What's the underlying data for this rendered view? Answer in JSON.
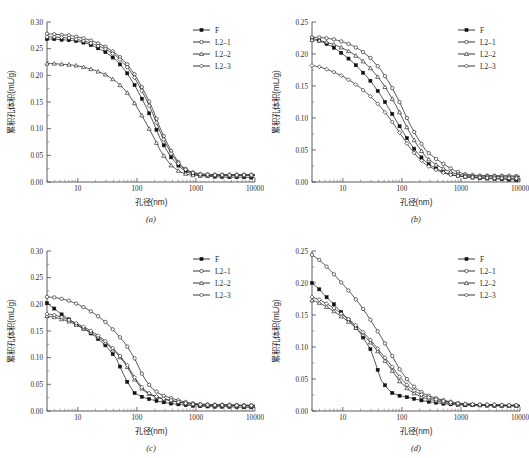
{
  "figure": {
    "panel_count": 4,
    "shared_xlabel": "孔径(nm)",
    "shared_ylabel": "累积孔体积(mL/g)",
    "series_names": [
      "F",
      "L2–1",
      "L2–2",
      "L2–3"
    ],
    "markers": [
      "filled-square",
      "open-circle",
      "open-triangle",
      "open-diamond"
    ],
    "line_color": "#222222"
  },
  "chart_data": [
    {
      "type": "line",
      "panel": "(a)",
      "title": "",
      "xlabel": "孔径(nm)",
      "ylabel": "累积孔体积(mL/g)",
      "xscale": "log",
      "xlim": [
        3,
        10000
      ],
      "ylim": [
        0.0,
        0.3
      ],
      "xticks": [
        10,
        100,
        1000,
        10000
      ],
      "xticklabels": [
        "10",
        "100",
        "1000",
        "10000"
      ],
      "yticks": [
        0.0,
        0.05,
        0.1,
        0.15,
        0.2,
        0.25,
        0.3
      ],
      "yticklabels": [
        "0.00",
        "0.05",
        "0.10",
        "0.15",
        "0.20",
        "0.25",
        "0.30"
      ],
      "grid": false,
      "legend_position": "top-right",
      "x": [
        3,
        4,
        5,
        7,
        10,
        14,
        20,
        30,
        45,
        65,
        90,
        130,
        180,
        260,
        380,
        550,
        800,
        1200,
        2000,
        3500,
        6000,
        10000
      ],
      "series": [
        {
          "name": "F",
          "marker": "filled-square",
          "values": [
            0.268,
            0.268,
            0.267,
            0.266,
            0.264,
            0.26,
            0.253,
            0.243,
            0.228,
            0.208,
            0.183,
            0.15,
            0.118,
            0.076,
            0.046,
            0.026,
            0.016,
            0.012,
            0.01,
            0.009,
            0.009,
            0.008
          ]
        },
        {
          "name": "L2–1",
          "marker": "open-circle",
          "values": [
            0.278,
            0.277,
            0.276,
            0.275,
            0.272,
            0.268,
            0.262,
            0.253,
            0.24,
            0.224,
            0.203,
            0.172,
            0.14,
            0.095,
            0.058,
            0.031,
            0.019,
            0.015,
            0.014,
            0.014,
            0.014,
            0.014
          ]
        },
        {
          "name": "L2–2",
          "marker": "open-triangle",
          "values": [
            0.222,
            0.222,
            0.221,
            0.22,
            0.218,
            0.214,
            0.209,
            0.201,
            0.188,
            0.171,
            0.149,
            0.119,
            0.09,
            0.055,
            0.031,
            0.018,
            0.013,
            0.012,
            0.012,
            0.012,
            0.012,
            0.012
          ]
        },
        {
          "name": "L2–3",
          "marker": "open-diamond",
          "values": [
            0.272,
            0.272,
            0.271,
            0.27,
            0.267,
            0.263,
            0.257,
            0.249,
            0.236,
            0.219,
            0.197,
            0.165,
            0.132,
            0.088,
            0.053,
            0.029,
            0.018,
            0.014,
            0.013,
            0.013,
            0.013,
            0.013
          ]
        }
      ]
    },
    {
      "type": "line",
      "panel": "(b)",
      "title": "",
      "xlabel": "孔径(nm)",
      "ylabel": "累积孔体积(mL/g)",
      "xscale": "log",
      "xlim": [
        3,
        10000
      ],
      "ylim": [
        0.0,
        0.25
      ],
      "xticks": [
        10,
        100,
        1000,
        10000
      ],
      "xticklabels": [
        "10",
        "100",
        "1000",
        "10000"
      ],
      "yticks": [
        0.0,
        0.05,
        0.1,
        0.15,
        0.2,
        0.25
      ],
      "yticklabels": [
        "0.00",
        "0.05",
        "0.10",
        "0.15",
        "0.20",
        "0.25"
      ],
      "grid": false,
      "legend_position": "top-right",
      "x": [
        3,
        4,
        5,
        7,
        10,
        14,
        20,
        30,
        45,
        65,
        90,
        130,
        180,
        260,
        380,
        550,
        800,
        1200,
        2000,
        3500,
        6000,
        10000
      ],
      "series": [
        {
          "name": "F",
          "marker": "filled-square",
          "values": [
            0.225,
            0.221,
            0.217,
            0.21,
            0.2,
            0.189,
            0.175,
            0.157,
            0.134,
            0.11,
            0.088,
            0.064,
            0.046,
            0.03,
            0.021,
            0.014,
            0.01,
            0.008,
            0.006,
            0.005,
            0.004,
            0.003
          ]
        },
        {
          "name": "L2–1",
          "marker": "open-circle",
          "values": [
            0.226,
            0.226,
            0.225,
            0.223,
            0.219,
            0.214,
            0.206,
            0.193,
            0.174,
            0.151,
            0.126,
            0.094,
            0.07,
            0.048,
            0.036,
            0.026,
            0.017,
            0.012,
            0.01,
            0.01,
            0.01,
            0.009
          ]
        },
        {
          "name": "L2–2",
          "marker": "open-triangle",
          "values": [
            0.222,
            0.221,
            0.219,
            0.215,
            0.209,
            0.202,
            0.192,
            0.177,
            0.157,
            0.134,
            0.11,
            0.08,
            0.058,
            0.038,
            0.027,
            0.019,
            0.013,
            0.01,
            0.009,
            0.009,
            0.008,
            0.008
          ]
        },
        {
          "name": "L2–3",
          "marker": "open-diamond",
          "values": [
            0.182,
            0.18,
            0.177,
            0.172,
            0.165,
            0.157,
            0.147,
            0.133,
            0.116,
            0.097,
            0.078,
            0.056,
            0.04,
            0.026,
            0.019,
            0.013,
            0.01,
            0.008,
            0.007,
            0.006,
            0.006,
            0.005
          ]
        }
      ]
    },
    {
      "type": "line",
      "panel": "(c)",
      "title": "",
      "xlabel": "孔径(nm)",
      "ylabel": "累积孔体积(mL/g)",
      "xscale": "log",
      "xlim": [
        3,
        10000
      ],
      "ylim": [
        0.0,
        0.3
      ],
      "xticks": [
        10,
        100,
        1000,
        10000
      ],
      "xticklabels": [
        "10",
        "100",
        "1000",
        "10000"
      ],
      "yticks": [
        0.0,
        0.05,
        0.1,
        0.15,
        0.2,
        0.25,
        0.3
      ],
      "yticklabels": [
        "0.00",
        "0.05",
        "0.10",
        "0.15",
        "0.20",
        "0.25",
        "0.30"
      ],
      "grid": false,
      "legend_position": "top-right",
      "x": [
        3,
        4,
        5,
        7,
        10,
        14,
        20,
        30,
        45,
        65,
        90,
        130,
        180,
        260,
        380,
        550,
        800,
        1200,
        2000,
        3500,
        6000,
        10000
      ],
      "series": [
        {
          "name": "F",
          "marker": "filled-square",
          "values": [
            0.202,
            0.192,
            0.183,
            0.172,
            0.161,
            0.151,
            0.139,
            0.122,
            0.098,
            0.059,
            0.034,
            0.025,
            0.021,
            0.017,
            0.014,
            0.012,
            0.01,
            0.009,
            0.008,
            0.008,
            0.007,
            0.007
          ]
        },
        {
          "name": "L2–1",
          "marker": "open-circle",
          "values": [
            0.214,
            0.213,
            0.211,
            0.207,
            0.2,
            0.192,
            0.181,
            0.166,
            0.146,
            0.125,
            0.1,
            0.063,
            0.042,
            0.03,
            0.024,
            0.019,
            0.015,
            0.013,
            0.012,
            0.012,
            0.011,
            0.011
          ]
        },
        {
          "name": "L2–2",
          "marker": "open-triangle",
          "values": [
            0.178,
            0.176,
            0.173,
            0.168,
            0.16,
            0.152,
            0.142,
            0.127,
            0.109,
            0.087,
            0.06,
            0.038,
            0.029,
            0.023,
            0.019,
            0.016,
            0.013,
            0.011,
            0.01,
            0.01,
            0.01,
            0.009
          ]
        },
        {
          "name": "L2–3",
          "marker": "open-diamond",
          "values": [
            0.182,
            0.18,
            0.177,
            0.171,
            0.163,
            0.155,
            0.145,
            0.13,
            0.111,
            0.09,
            0.064,
            0.04,
            0.03,
            0.024,
            0.02,
            0.016,
            0.013,
            0.012,
            0.011,
            0.011,
            0.01,
            0.01
          ]
        }
      ]
    },
    {
      "type": "line",
      "panel": "(d)",
      "title": "",
      "xlabel": "孔径(nm)",
      "ylabel": "累积孔体积(mL/g)",
      "xscale": "log",
      "xlim": [
        3,
        10000
      ],
      "ylim": [
        0.0,
        0.25
      ],
      "xticks": [
        10,
        100,
        1000,
        10000
      ],
      "xticklabels": [
        "10",
        "100",
        "1000",
        "10000"
      ],
      "yticks": [
        0.0,
        0.05,
        0.1,
        0.15,
        0.2,
        0.25
      ],
      "yticklabels": [
        "0.00",
        "0.05",
        "0.10",
        "0.15",
        "0.20",
        "0.25"
      ],
      "grid": false,
      "legend_position": "top-right",
      "x": [
        3,
        4,
        5,
        7,
        10,
        14,
        20,
        30,
        45,
        65,
        90,
        130,
        180,
        260,
        380,
        550,
        800,
        1200,
        2000,
        3500,
        6000,
        10000
      ],
      "series": [
        {
          "name": "F",
          "marker": "filled-square",
          "values": [
            0.2,
            0.19,
            0.18,
            0.167,
            0.152,
            0.138,
            0.121,
            0.095,
            0.047,
            0.029,
            0.024,
            0.021,
            0.018,
            0.015,
            0.013,
            0.011,
            0.01,
            0.009,
            0.009,
            0.008,
            0.008,
            0.008
          ]
        },
        {
          "name": "L2–1",
          "marker": "open-circle",
          "values": [
            0.244,
            0.236,
            0.228,
            0.214,
            0.198,
            0.183,
            0.165,
            0.141,
            0.115,
            0.09,
            0.066,
            0.046,
            0.034,
            0.025,
            0.02,
            0.016,
            0.013,
            0.011,
            0.01,
            0.01,
            0.009,
            0.009
          ]
        },
        {
          "name": "L2–2",
          "marker": "open-triangle",
          "values": [
            0.173,
            0.169,
            0.164,
            0.156,
            0.146,
            0.136,
            0.123,
            0.106,
            0.086,
            0.066,
            0.047,
            0.033,
            0.025,
            0.019,
            0.016,
            0.013,
            0.011,
            0.01,
            0.009,
            0.009,
            0.008,
            0.008
          ]
        },
        {
          "name": "L2–3",
          "marker": "open-diamond",
          "values": [
            0.178,
            0.174,
            0.169,
            0.161,
            0.15,
            0.14,
            0.127,
            0.11,
            0.09,
            0.072,
            0.054,
            0.038,
            0.029,
            0.022,
            0.018,
            0.015,
            0.012,
            0.011,
            0.01,
            0.01,
            0.009,
            0.009
          ]
        }
      ]
    }
  ]
}
